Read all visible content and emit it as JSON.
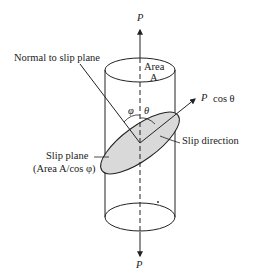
{
  "diagram": {
    "type": "slip-system-resolved-shear-stress",
    "labels": {
      "force_top": "P",
      "force_bottom": "P",
      "normal": "Normal to slip plane",
      "area_line1": "Area",
      "area_line2": "A",
      "phi": "φ",
      "theta": "θ",
      "force_component_p": "P",
      "force_component_cos": "cos θ",
      "slip_direction": "Slip direction",
      "slip_plane_line1": "Slip plane",
      "slip_plane_line2": "(Area A/cos φ)"
    },
    "colors": {
      "stroke": "#222222",
      "slip_plane_fill": "#d9d9d9",
      "background": "#ffffff"
    }
  }
}
